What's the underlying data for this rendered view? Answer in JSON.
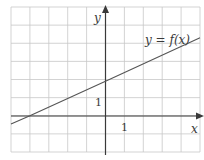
{
  "chart_data": {
    "type": "line",
    "title": "",
    "xlabel": "x",
    "ylabel": "y",
    "xlim": [
      -5,
      5
    ],
    "ylim": [
      -2,
      6
    ],
    "grid": true,
    "grid_step": 1,
    "tick_labels": {
      "x": [
        "1"
      ],
      "y": [
        "1"
      ]
    },
    "series": [
      {
        "name": "y = f(x)",
        "x": [
          -5,
          -4,
          0,
          5
        ],
        "y": [
          -0.45,
          0.0,
          1.9,
          4.3
        ]
      }
    ],
    "annotations": [
      {
        "text": "y = f(x)",
        "near": [
          3.3,
          4.2
        ]
      }
    ],
    "legend": "none"
  },
  "labels": {
    "y_axis": "y",
    "x_axis": "x",
    "y_tick": "1",
    "x_tick": "1",
    "curve": "y = f(x)"
  },
  "colors": {
    "grid": "#c8c8c8",
    "axis": "#3a3a3a",
    "curve": "#555555",
    "text": "#3a3a3a"
  }
}
